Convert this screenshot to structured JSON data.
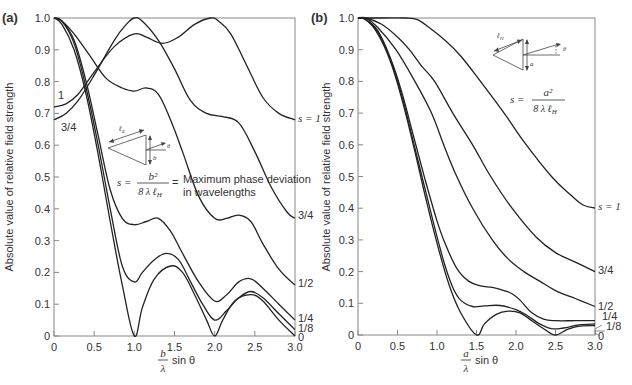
{
  "chart_data": [
    {
      "panel_label": "(a)",
      "type": "line",
      "title": "",
      "xlabel": "b/λ sin θ",
      "xlabel_num": "b",
      "xlabel_den": "λ",
      "xlabel_suffix": "sin θ",
      "ylabel": "Absolute value of relative field strength",
      "xlim": [
        0,
        3.0
      ],
      "ylim": [
        0,
        1.0
      ],
      "xticks": [
        "0",
        "0.5",
        "1.0",
        "1.5",
        "2.0",
        "2.5",
        "3.0"
      ],
      "yticks": [
        "0",
        "0.1",
        "0.2",
        "0.3",
        "0.4",
        "0.5",
        "0.6",
        "0.7",
        "0.8",
        "0.9",
        "1.0"
      ],
      "grid": false,
      "annotation": {
        "formula_lhs": "s =",
        "formula_num": "b²",
        "formula_den": "8 λ ℓ",
        "formula_den_sub": "H",
        "formula_eq": "=",
        "text_line1": "Maximum phase deviation",
        "text_line2": "in wavelengths",
        "diagram_labels": {
          "length": "ℓ",
          "length_sub": "E",
          "dim": "b",
          "angle": "θ"
        }
      },
      "left_labels": [
        {
          "text": "1",
          "for": "s=1"
        },
        {
          "text": "3/4",
          "for": "s=3/4"
        }
      ],
      "series": [
        {
          "name": "s=1",
          "label": "s = 1",
          "x": [
            0,
            0.15,
            0.3,
            0.5,
            0.75,
            1.0,
            1.15,
            1.35,
            1.55,
            1.75,
            1.95,
            2.05,
            2.2,
            2.4,
            2.6,
            2.8,
            3.0
          ],
          "y": [
            0.72,
            0.73,
            0.76,
            0.83,
            0.91,
            0.95,
            0.94,
            0.92,
            0.94,
            0.98,
            1.0,
            0.99,
            0.95,
            0.85,
            0.75,
            0.7,
            0.68
          ]
        },
        {
          "name": "s=3/4",
          "label": "3/4",
          "x": [
            0,
            0.15,
            0.3,
            0.5,
            0.75,
            0.9,
            1.0,
            1.1,
            1.3,
            1.5,
            1.7,
            1.9,
            2.1,
            2.3,
            2.5,
            2.7,
            2.9,
            3.0
          ],
          "y": [
            0.68,
            0.7,
            0.74,
            0.82,
            0.93,
            0.98,
            1.0,
            0.99,
            0.93,
            0.84,
            0.74,
            0.7,
            0.69,
            0.67,
            0.58,
            0.47,
            0.39,
            0.37
          ]
        },
        {
          "name": "s=1/2",
          "label": "1/2",
          "x": [
            0,
            0.1,
            0.25,
            0.45,
            0.65,
            0.85,
            1.0,
            1.15,
            1.3,
            1.45,
            1.6,
            1.8,
            2.0,
            2.15,
            2.3,
            2.45,
            2.6,
            2.8,
            3.0
          ],
          "y": [
            1.0,
            0.99,
            0.95,
            0.88,
            0.81,
            0.78,
            0.77,
            0.78,
            0.76,
            0.68,
            0.58,
            0.44,
            0.37,
            0.37,
            0.38,
            0.36,
            0.29,
            0.21,
            0.16
          ]
        },
        {
          "name": "s=1/4",
          "label": "1/4",
          "x": [
            0,
            0.1,
            0.25,
            0.4,
            0.55,
            0.7,
            0.85,
            1.0,
            1.15,
            1.3,
            1.45,
            1.6,
            1.8,
            2.0,
            2.15,
            2.3,
            2.45,
            2.6,
            2.8,
            3.0
          ],
          "y": [
            1.0,
            0.99,
            0.93,
            0.8,
            0.63,
            0.46,
            0.37,
            0.35,
            0.36,
            0.37,
            0.33,
            0.26,
            0.17,
            0.11,
            0.13,
            0.17,
            0.18,
            0.15,
            0.1,
            0.05
          ]
        },
        {
          "name": "s=1/8",
          "label": "1/8",
          "x": [
            0,
            0.1,
            0.25,
            0.4,
            0.55,
            0.7,
            0.85,
            1.0,
            1.1,
            1.25,
            1.4,
            1.55,
            1.7,
            1.85,
            2.0,
            2.15,
            2.3,
            2.45,
            2.6,
            2.8,
            3.0
          ],
          "y": [
            1.0,
            0.99,
            0.92,
            0.78,
            0.6,
            0.4,
            0.22,
            0.17,
            0.2,
            0.24,
            0.26,
            0.24,
            0.17,
            0.1,
            0.05,
            0.08,
            0.12,
            0.14,
            0.12,
            0.07,
            0.02
          ]
        },
        {
          "name": "s=0",
          "label": "0",
          "x": [
            0,
            0.1,
            0.25,
            0.4,
            0.55,
            0.7,
            0.85,
            1.0,
            1.1,
            1.25,
            1.45,
            1.6,
            1.75,
            1.9,
            2.0,
            2.1,
            2.25,
            2.45,
            2.6,
            2.8,
            3.0
          ],
          "y": [
            1.0,
            0.98,
            0.9,
            0.76,
            0.57,
            0.36,
            0.16,
            0.0,
            0.09,
            0.18,
            0.22,
            0.2,
            0.13,
            0.05,
            0.0,
            0.05,
            0.11,
            0.13,
            0.11,
            0.05,
            0.0
          ]
        }
      ]
    },
    {
      "panel_label": "(b)",
      "type": "line",
      "title": "",
      "xlabel": "a/λ sin θ",
      "xlabel_num": "a",
      "xlabel_den": "λ",
      "xlabel_suffix": "sin θ",
      "ylabel": "Absolute value of relative field strength",
      "xlim": [
        0,
        3.0
      ],
      "ylim": [
        0,
        1.0
      ],
      "xticks": [
        "0",
        "0.5",
        "1.0",
        "1.5",
        "2.0",
        "2.5",
        "3.0"
      ],
      "yticks": [
        "0",
        "0.1",
        "0.2",
        "0.3",
        "0.4",
        "0.5",
        "0.6",
        "0.7",
        "0.8",
        "0.9",
        "1.0"
      ],
      "grid": false,
      "annotation": {
        "formula_lhs": "s =",
        "formula_num": "a²",
        "formula_den": "8 λ ℓ",
        "formula_den_sub": "H",
        "diagram_labels": {
          "length": "ℓ",
          "length_sub": "H",
          "dim": "a",
          "angle": "θ"
        }
      },
      "series": [
        {
          "name": "s=1",
          "label": "s = 1",
          "x": [
            0,
            0.3,
            0.6,
            0.75,
            0.9,
            1.1,
            1.3,
            1.55,
            1.85,
            2.1,
            2.45,
            2.7,
            2.85,
            3.0
          ],
          "y": [
            1.0,
            1.0,
            1.0,
            0.995,
            0.97,
            0.93,
            0.88,
            0.8,
            0.7,
            0.61,
            0.5,
            0.44,
            0.41,
            0.4
          ]
        },
        {
          "name": "s=3/4",
          "label": "3/4",
          "x": [
            0,
            0.1,
            0.3,
            0.5,
            0.65,
            0.8,
            0.97,
            1.2,
            1.45,
            1.68,
            1.95,
            2.25,
            2.5,
            2.75,
            3.0
          ],
          "y": [
            1.0,
            1.0,
            0.98,
            0.94,
            0.9,
            0.85,
            0.8,
            0.7,
            0.6,
            0.5,
            0.4,
            0.31,
            0.26,
            0.23,
            0.2
          ]
        },
        {
          "name": "s=1/2",
          "label": "1/2",
          "x": [
            0,
            0.1,
            0.25,
            0.48,
            0.72,
            0.93,
            1.1,
            1.25,
            1.45,
            1.7,
            1.9,
            2.1,
            2.3,
            2.5,
            2.75,
            3.0
          ],
          "y": [
            1.0,
            1.0,
            0.97,
            0.9,
            0.8,
            0.7,
            0.59,
            0.5,
            0.4,
            0.3,
            0.24,
            0.2,
            0.17,
            0.14,
            0.115,
            0.09
          ]
        },
        {
          "name": "s=1/4",
          "label": "1/4",
          "x": [
            0,
            0.1,
            0.25,
            0.4,
            0.55,
            0.7,
            0.85,
            1.0,
            1.1,
            1.25,
            1.4,
            1.55,
            1.7,
            1.85,
            1.95,
            2.05,
            2.2,
            2.35,
            2.5,
            2.75,
            3.0
          ],
          "y": [
            1.0,
            0.995,
            0.96,
            0.88,
            0.77,
            0.63,
            0.49,
            0.36,
            0.29,
            0.21,
            0.17,
            0.155,
            0.15,
            0.14,
            0.13,
            0.11,
            0.07,
            0.05,
            0.045,
            0.045,
            0.045
          ]
        },
        {
          "name": "s=1/8",
          "label": "1/8",
          "x": [
            0,
            0.1,
            0.25,
            0.4,
            0.55,
            0.7,
            0.85,
            1.0,
            1.1,
            1.2,
            1.3,
            1.45,
            1.6,
            1.8,
            2.0,
            2.15,
            2.3,
            2.45,
            2.6,
            2.8,
            3.0
          ],
          "y": [
            1.0,
            0.995,
            0.955,
            0.875,
            0.76,
            0.61,
            0.46,
            0.31,
            0.22,
            0.15,
            0.11,
            0.09,
            0.092,
            0.093,
            0.08,
            0.06,
            0.035,
            0.02,
            0.022,
            0.032,
            0.035
          ]
        },
        {
          "name": "s=0",
          "label": "0",
          "x": [
            0,
            0.1,
            0.25,
            0.4,
            0.55,
            0.7,
            0.85,
            1.0,
            1.15,
            1.3,
            1.5,
            1.6,
            1.75,
            1.9,
            2.05,
            2.2,
            2.35,
            2.5,
            2.65,
            2.8,
            3.0
          ],
          "y": [
            1.0,
            0.995,
            0.95,
            0.87,
            0.75,
            0.6,
            0.44,
            0.29,
            0.16,
            0.07,
            0.0,
            0.035,
            0.065,
            0.075,
            0.07,
            0.045,
            0.02,
            0.0,
            0.018,
            0.028,
            0.03
          ]
        }
      ]
    }
  ]
}
